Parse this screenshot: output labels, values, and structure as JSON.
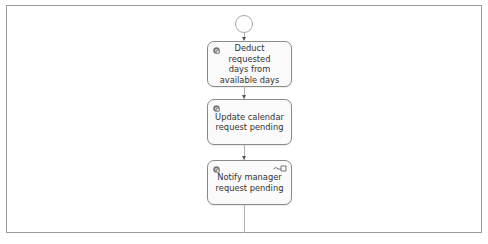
{
  "diagram": {
    "type": "process-flow",
    "start_event": {
      "shape": "circle"
    },
    "tasks": [
      {
        "label": "Deduct requested days from available days",
        "lines": [
          "Deduct requested",
          "days from",
          "available days"
        ],
        "icon": "gear-icon"
      },
      {
        "label": "Update calendar request pending",
        "lines": [
          "Update calendar",
          "request pending"
        ],
        "icon": "gear-icon"
      },
      {
        "label": "Notify manager request pending",
        "lines": [
          "Notify manager",
          "request pending"
        ],
        "icon": "gear-icon",
        "secondary_icon": "send-message-icon"
      }
    ],
    "edges": [
      {
        "from": "start_event",
        "to": "task-0"
      },
      {
        "from": "task-0",
        "to": "task-1"
      },
      {
        "from": "task-1",
        "to": "task-2"
      },
      {
        "from": "task-2",
        "to": "continues-below"
      }
    ],
    "colors": {
      "border": "#8a8a8a",
      "connector": "#b0b0b0",
      "text": "#333333",
      "frame": "#9a9a9a"
    }
  }
}
